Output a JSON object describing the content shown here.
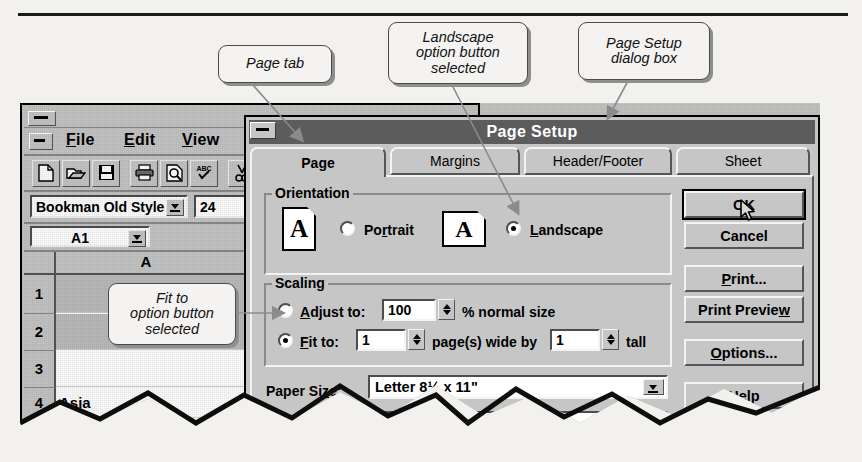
{
  "callouts": [
    {
      "id": "page-tab",
      "text": "Page tab"
    },
    {
      "id": "landscape",
      "line1": "Landscape",
      "line2": "option button",
      "line3": "selected"
    },
    {
      "id": "dialog",
      "line1": "Page Setup",
      "line2": "dialog box"
    },
    {
      "id": "fit-to",
      "line1": "Fit to",
      "line2": "option button",
      "line3": "selected"
    }
  ],
  "excel": {
    "menus": [
      {
        "label": "File",
        "accel": "F",
        "rest": "ile"
      },
      {
        "label": "Edit",
        "accel": "E",
        "rest": "dit"
      },
      {
        "label": "View",
        "accel": "V",
        "rest": "iew"
      },
      {
        "label": "In",
        "accel": "I",
        "rest": "n"
      }
    ],
    "toolbar_icons": [
      "new-file-icon",
      "open-folder-icon",
      "save-floppy-icon",
      "print-icon",
      "print-preview-icon",
      "spelling-check-icon",
      "cut-scissors-icon"
    ],
    "font_name": "Bookman Old Style",
    "font_size": "24",
    "name_box": "A1",
    "column_header": "A",
    "rows": [
      {
        "num": "1",
        "value": ""
      },
      {
        "num": "2",
        "value": ""
      },
      {
        "num": "3",
        "value": ""
      },
      {
        "num": "4",
        "value": "Asia"
      },
      {
        "num": "5",
        "value": "C"
      }
    ]
  },
  "dialog": {
    "title": "Page Setup",
    "tabs": [
      {
        "label": "Page",
        "selected": true
      },
      {
        "label": "Margins",
        "selected": false
      },
      {
        "label": "Header/Footer",
        "selected": false
      },
      {
        "label": "Sheet",
        "selected": false
      }
    ],
    "orientation": {
      "group_label": "Orientation",
      "portrait": {
        "label": "Portrait",
        "accel": "r",
        "selected": false,
        "icon": "portrait-page-icon",
        "glyph": "A"
      },
      "landscape": {
        "label": "Landscape",
        "accel": "L",
        "selected": true,
        "icon": "landscape-page-icon",
        "glyph": "A"
      }
    },
    "scaling": {
      "group_label": "Scaling",
      "adjust": {
        "label": "Adjust to:",
        "accel": "A",
        "value": "100",
        "suffix": "% normal size",
        "selected": false
      },
      "fit": {
        "label": "Fit to:",
        "accel": "F",
        "wide_value": "1",
        "mid_text": "page(s) wide by",
        "tall_value": "1",
        "suffix": "tall",
        "selected": true
      }
    },
    "paper_size": {
      "label": "Paper Size:",
      "accel": "z",
      "value": "Letter 8½ x 11\""
    },
    "print_quality": {
      "label": "Print Quality:",
      "accel": "Q",
      "value": "300 d"
    },
    "buttons": [
      {
        "label": "OK",
        "accel": "O",
        "default": true
      },
      {
        "label": "Cancel",
        "accel": "",
        "default": false
      },
      {
        "label": "Print...",
        "accel": "P",
        "default": false
      },
      {
        "label": "Print Preview",
        "accel": "w",
        "default": false
      },
      {
        "label": "Options...",
        "accel": "O",
        "default": false
      },
      {
        "label": "Help",
        "accel": "H",
        "default": false
      }
    ]
  },
  "colors": {
    "page_bg": "#f2f1ee",
    "win_face": "#c6c6c6",
    "titlebar": "#5c5c5c",
    "titlebar_text": "#ffffff",
    "shadow": "#4d4d4d",
    "highlight": "#f3f3f3"
  }
}
